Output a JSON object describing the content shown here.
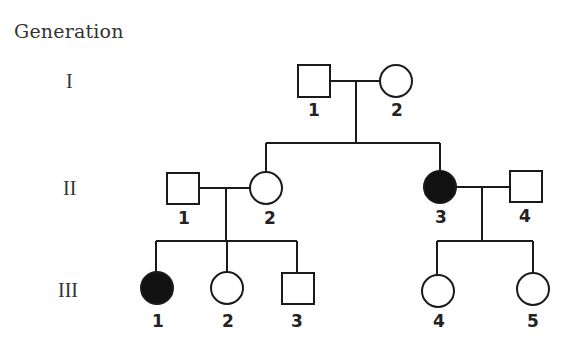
{
  "title": "Generation",
  "generations": [
    {
      "label": "I"
    },
    {
      "label": "II"
    },
    {
      "label": "III"
    }
  ],
  "colors": {
    "line": "#1a1a1a",
    "affected": "#111111",
    "unaffected": "#ffffff",
    "text": "#333333"
  },
  "individuals": {
    "I_1": {
      "number": "1",
      "sex": "male",
      "affected": false
    },
    "I_2": {
      "number": "2",
      "sex": "female",
      "affected": false
    },
    "II_1": {
      "number": "1",
      "sex": "male",
      "affected": false
    },
    "II_2": {
      "number": "2",
      "sex": "female",
      "affected": false
    },
    "II_3": {
      "number": "3",
      "sex": "female",
      "affected": true
    },
    "II_4": {
      "number": "4",
      "sex": "male",
      "affected": false
    },
    "III_1": {
      "number": "1",
      "sex": "female",
      "affected": true
    },
    "III_2": {
      "number": "2",
      "sex": "female",
      "affected": false
    },
    "III_3": {
      "number": "3",
      "sex": "male",
      "affected": false
    },
    "III_4": {
      "number": "4",
      "sex": "female",
      "affected": false
    },
    "III_5": {
      "number": "5",
      "sex": "female",
      "affected": false
    }
  },
  "legend": {
    "square": "male",
    "circle": "female",
    "filled": "affected",
    "open": "unaffected"
  }
}
